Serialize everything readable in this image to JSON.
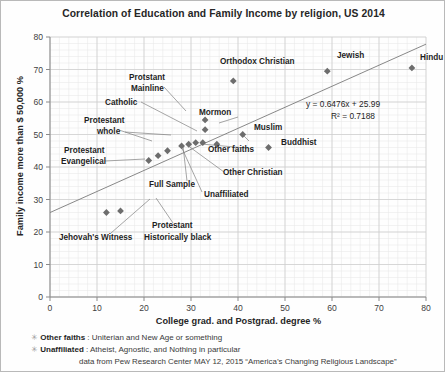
{
  "chart_data": {
    "type": "scatter",
    "title": "Correlation of Education and Family Income by religion, US 2014",
    "xlabel": "College grad. and Postgrad. degree  %",
    "ylabel": "Family income  more than  $ 50,000 %",
    "xlim": [
      0,
      80
    ],
    "ylim": [
      0,
      80
    ],
    "xticks": [
      0,
      10,
      20,
      30,
      40,
      50,
      60,
      70,
      80
    ],
    "yticks": [
      0,
      10,
      20,
      30,
      40,
      50,
      60,
      70,
      80
    ],
    "grid": true,
    "legend": "none",
    "trendline": {
      "equation": "y = 0.6476x + 25.99",
      "r2": "R² = 0.7188",
      "slope": 0.6476,
      "intercept": 25.99
    },
    "points": [
      {
        "label": "Hindu",
        "x": 77,
        "y": 70.5
      },
      {
        "label": "Jewish",
        "x": 59,
        "y": 69.5
      },
      {
        "label": "Orthodox Christian",
        "x": 39,
        "y": 66.5
      },
      {
        "label": "Mormon",
        "x": 33,
        "y": 54.5
      },
      {
        "label": "Protstant Mainline",
        "x": 33,
        "y": 51.5
      },
      {
        "label": "Muslim",
        "x": 41,
        "y": 50
      },
      {
        "label": "Buddhist",
        "x": 46.5,
        "y": 46
      },
      {
        "label": "Other faiths",
        "x": 35.5,
        "y": 47
      },
      {
        "label": "Unaffiliated",
        "x": 31,
        "y": 47.5
      },
      {
        "label": "Other Christian",
        "x": 32.5,
        "y": 47.5
      },
      {
        "label": "Full Sample",
        "x": 29.5,
        "y": 47
      },
      {
        "label": "Catholic",
        "x": 28,
        "y": 46.5
      },
      {
        "label": "Protestant whole",
        "x": 25,
        "y": 45
      },
      {
        "label": "",
        "x": 23,
        "y": 43.5
      },
      {
        "label": "Protestant Evangelical",
        "x": 21,
        "y": 42
      },
      {
        "label": "Protestant Historically black",
        "x": 15,
        "y": 26.5
      },
      {
        "label": "Jehovah's Witness",
        "x": 12,
        "y": 26
      }
    ],
    "annotations": [
      {
        "name": "hindu",
        "text": "Hindu",
        "lx": 419,
        "ly": 59
      },
      {
        "name": "jewish",
        "text": "Jewish",
        "lx": 336,
        "ly": 57
      },
      {
        "name": "orthodox-christian",
        "text": "Orthodox Christian",
        "lx": 219,
        "ly": 63
      },
      {
        "name": "protstant-mainline-1",
        "text": "Protstant",
        "lx": 128,
        "ly": 79
      },
      {
        "name": "protstant-mainline-2",
        "text": "Mainline",
        "lx": 130,
        "ly": 90
      },
      {
        "name": "catholic",
        "text": "Catholic",
        "lx": 104,
        "ly": 104
      },
      {
        "name": "mormon",
        "text": "Mormon",
        "lx": 198,
        "ly": 114
      },
      {
        "name": "protestant-whole-1",
        "text": "Protestant",
        "lx": 83,
        "ly": 122
      },
      {
        "name": "protestant-whole-2",
        "text": "whole",
        "lx": 96,
        "ly": 133
      },
      {
        "name": "muslim",
        "text": "Muslim",
        "lx": 253,
        "ly": 129
      },
      {
        "name": "buddhist",
        "text": "Buddhist",
        "lx": 280,
        "ly": 144
      },
      {
        "name": "protestant-evangelical-1",
        "text": "Protestant",
        "lx": 63,
        "ly": 152
      },
      {
        "name": "protestant-evangelical-2",
        "text": "Evangelical",
        "lx": 60,
        "ly": 163
      },
      {
        "name": "other-faiths",
        "text": "Other faiths",
        "lx": 207,
        "ly": 151
      },
      {
        "name": "other-christian",
        "text": "Other Christian",
        "lx": 222,
        "ly": 174
      },
      {
        "name": "full-sample",
        "text": "Full Sample",
        "lx": 148,
        "ly": 186
      },
      {
        "name": "unaffiliated",
        "text": "Unaffiliated",
        "lx": 203,
        "ly": 196
      },
      {
        "name": "jehovahs-witness",
        "text": "Jehovah's Witness",
        "lx": 58,
        "ly": 239
      },
      {
        "name": "protestant-historically-black-1",
        "text": "Protestant",
        "lx": 151,
        "ly": 227
      },
      {
        "name": "protestant-historically-black-2",
        "text": "Historically black",
        "lx": 143,
        "ly": 239
      }
    ]
  },
  "notes": {
    "note1_bullet": "✳",
    "note1_term": "Other faiths",
    "note1_text": " : Uniterian and New Age or something",
    "note2_bullet": "✳",
    "note2_term": "Unaffiliated",
    "note2_text": " : Atheist, Agnostic, and Nothing in particular",
    "source": "data from Pew Research Center MAY 12, 2015 “America’s Changing Religious Landscape”"
  }
}
